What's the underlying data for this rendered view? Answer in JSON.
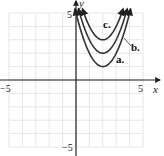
{
  "chart_data": {
    "type": "line",
    "title": "",
    "xlabel": "x",
    "ylabel": "y",
    "xlim": [
      -5,
      5
    ],
    "ylim": [
      -5,
      5
    ],
    "grid": true,
    "tick_labels": {
      "x_min": "−5",
      "x_max": "5",
      "y_min": "−5",
      "y_max": "5"
    },
    "series": [
      {
        "name": "a.",
        "function": "y = (x - 2)^2 + 1",
        "vertex": [
          2,
          1
        ],
        "x": [
          0.0,
          0.5,
          1.0,
          1.5,
          2.0,
          2.5,
          3.0,
          3.5,
          4.0
        ],
        "values": [
          5.0,
          3.25,
          2.0,
          1.25,
          1.0,
          1.25,
          2.0,
          3.25,
          5.0
        ]
      },
      {
        "name": "b.",
        "function": "y = (x - 2)^2 + 2",
        "vertex": [
          2,
          2
        ],
        "x": [
          0.27,
          0.5,
          1.0,
          1.5,
          2.0,
          2.5,
          3.0,
          3.5,
          3.73
        ],
        "values": [
          5.0,
          4.25,
          3.0,
          2.25,
          2.0,
          2.25,
          3.0,
          4.25,
          5.0
        ]
      },
      {
        "name": "c.",
        "function": "y = (x - 2)^2 + 3",
        "vertex": [
          2,
          3
        ],
        "x": [
          0.59,
          1.0,
          1.5,
          2.0,
          2.5,
          3.0,
          3.41
        ],
        "values": [
          5.0,
          4.0,
          3.25,
          3.0,
          3.25,
          4.0,
          5.0
        ]
      }
    ]
  },
  "labels": {
    "x_axis": "x",
    "y_axis": "y",
    "x_min": "−5",
    "x_max": "5",
    "y_min": "−5",
    "y_max": "5",
    "curve_a": "a.",
    "curve_b": "b.",
    "curve_c": "c."
  }
}
